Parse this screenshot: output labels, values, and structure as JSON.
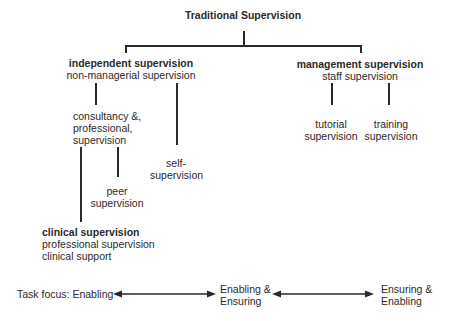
{
  "title": "Traditional Supervision",
  "branches": {
    "independent": {
      "title": "independent supervision",
      "subtitle": "non-managerial supervision",
      "children": {
        "consultancy": [
          "consultancy &,",
          "professional,",
          "supervision"
        ],
        "self": [
          "self-",
          "supervision"
        ],
        "peer": [
          "peer",
          "supervision"
        ],
        "clinical": {
          "title": "clinical supervision",
          "lines": [
            "professional supervision",
            "clinical support"
          ]
        }
      }
    },
    "management": {
      "title": "management supervision",
      "subtitle": "staff supervision",
      "children": {
        "tutorial": [
          "tutorial",
          "supervision"
        ],
        "training": [
          "training",
          "supervision"
        ]
      }
    }
  },
  "task_focus": {
    "left": "Task focus: Enabling",
    "middle": [
      "Enabling &",
      "Ensuring"
    ],
    "right": [
      "Ensuring &",
      "Enabling"
    ]
  }
}
